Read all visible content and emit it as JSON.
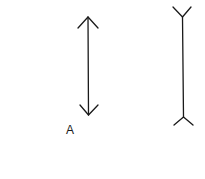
{
  "figure": {
    "labels": {
      "a": "A"
    },
    "stroke_color": "#1a1a1a",
    "background": "#ffffff",
    "figures": [
      {
        "id": "A",
        "type": "arrowheads-inward",
        "x": 88,
        "y_top": 17,
        "y_bottom": 115
      },
      {
        "id": "B",
        "type": "fins-outward",
        "x": 183,
        "y_top": 17,
        "y_bottom": 117
      }
    ]
  }
}
